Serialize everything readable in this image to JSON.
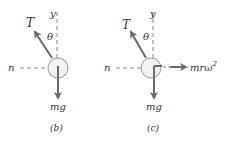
{
  "panels": [
    {
      "id": "b",
      "caption": "(b)",
      "tension_label": "T",
      "angle_label": "θ",
      "vertical_axis_label": "y",
      "normal_axis_label": "n",
      "weight_label": "mg"
    },
    {
      "id": "c",
      "caption": "(c)",
      "tension_label": "T",
      "angle_label": "θ",
      "vertical_axis_label": "y",
      "normal_axis_label": "n",
      "weight_label": "mg",
      "inertial_label": "mrω",
      "inertial_exponent": "2"
    }
  ],
  "colors": {
    "arrow": "#6b6b6b",
    "circle_fill": "#f2f2f2",
    "dashes": "#888888",
    "text": "#333333"
  }
}
